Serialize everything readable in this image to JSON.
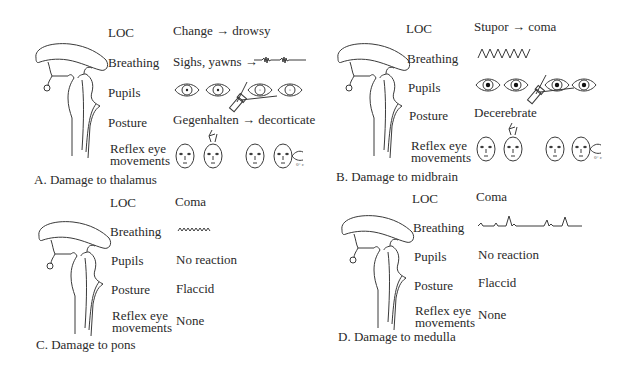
{
  "panels": {
    "a": {
      "caption": "A. Damage to thalamus",
      "rows": {
        "loc": {
          "label": "LOC",
          "value": "Change → drowsy"
        },
        "breathing": {
          "label": "Breathing",
          "value": "Sighs, yawns →",
          "pattern": "cheyne-stokes"
        },
        "pupils": {
          "label": "Pupils",
          "value": "",
          "pattern": "small-reactive"
        },
        "posture": {
          "label": "Posture",
          "value": "Gegenhalten → decorticate"
        },
        "reflex": {
          "label_line1": "Reflex eye",
          "label_line2": "movements",
          "value": "",
          "pattern": "full-eye-movements"
        }
      }
    },
    "b": {
      "caption": "B. Damage to midbrain",
      "rows": {
        "loc": {
          "label": "LOC",
          "value": "Stupor → coma"
        },
        "breathing": {
          "label": "Breathing",
          "value": "",
          "pattern": "hyperventilation"
        },
        "pupils": {
          "label": "Pupils",
          "value": "",
          "pattern": "midposition-fixed"
        },
        "posture": {
          "label": "Posture",
          "value": "Decerebrate"
        },
        "reflex": {
          "label_line1": "Reflex eye",
          "label_line2": "movements",
          "value": "",
          "pattern": "impaired-eye-movements"
        }
      }
    },
    "c": {
      "caption": "C. Damage to pons",
      "rows": {
        "loc": {
          "label": "LOC",
          "value": "Coma"
        },
        "breathing": {
          "label": "Breathing",
          "value": "",
          "pattern": "apneustic"
        },
        "pupils": {
          "label": "Pupils",
          "value": "No reaction"
        },
        "posture": {
          "label": "Posture",
          "value": "Flaccid"
        },
        "reflex": {
          "label_line1": "Reflex eye",
          "label_line2": "movements",
          "value": "None"
        }
      }
    },
    "d": {
      "caption": "D. Damage to medulla",
      "rows": {
        "loc": {
          "label": "LOC",
          "value": "Coma"
        },
        "breathing": {
          "label": "Breathing",
          "value": "",
          "pattern": "ataxic"
        },
        "pupils": {
          "label": "Pupils",
          "value": "No reaction"
        },
        "posture": {
          "label": "Posture",
          "value": "Flaccid"
        },
        "reflex": {
          "label_line1": "Reflex eye",
          "label_line2": "movements",
          "value": "None"
        }
      }
    }
  },
  "annotations": {
    "ice_water": "0° c"
  }
}
